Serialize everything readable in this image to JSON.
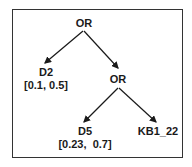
{
  "diagram": {
    "type": "tree",
    "nodes": [
      {
        "id": "root",
        "label": "OR",
        "range": ""
      },
      {
        "id": "d2",
        "label": "D2",
        "range": "[0.1, 0.5]"
      },
      {
        "id": "or2",
        "label": "OR",
        "range": ""
      },
      {
        "id": "d5",
        "label": "D5",
        "range": "[0.23,  0.7]"
      },
      {
        "id": "kb",
        "label": "KB1_22",
        "range": ""
      }
    ],
    "edges": [
      {
        "from": "root",
        "to": "d2"
      },
      {
        "from": "root",
        "to": "or2"
      },
      {
        "from": "or2",
        "to": "d5"
      },
      {
        "from": "or2",
        "to": "kb"
      }
    ],
    "colors": {
      "line": "#1a1a1a",
      "frame": "#333333"
    }
  }
}
